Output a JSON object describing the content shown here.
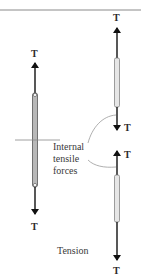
{
  "diagram": {
    "type": "free-body-tension",
    "colors": {
      "top_rule": "#8a8a8a",
      "arrow": "#111111",
      "bar_whole_fill": "#b8b8b8",
      "bar_section_fill": "#e6e6e6",
      "bar_stroke": "#555555",
      "cut_line": "#888888",
      "leader": "#9a9a9a"
    },
    "left_member": {
      "top_force_label": "T",
      "bottom_force_label": "T"
    },
    "right_upper_segment": {
      "top_force_label": "T",
      "bottom_force_label": "T"
    },
    "right_lower_segment": {
      "top_force_label": "T",
      "bottom_force_label": "T"
    },
    "annotation": {
      "lines": [
        "Internal",
        "tensile",
        "forces"
      ]
    },
    "caption": "Tension"
  }
}
